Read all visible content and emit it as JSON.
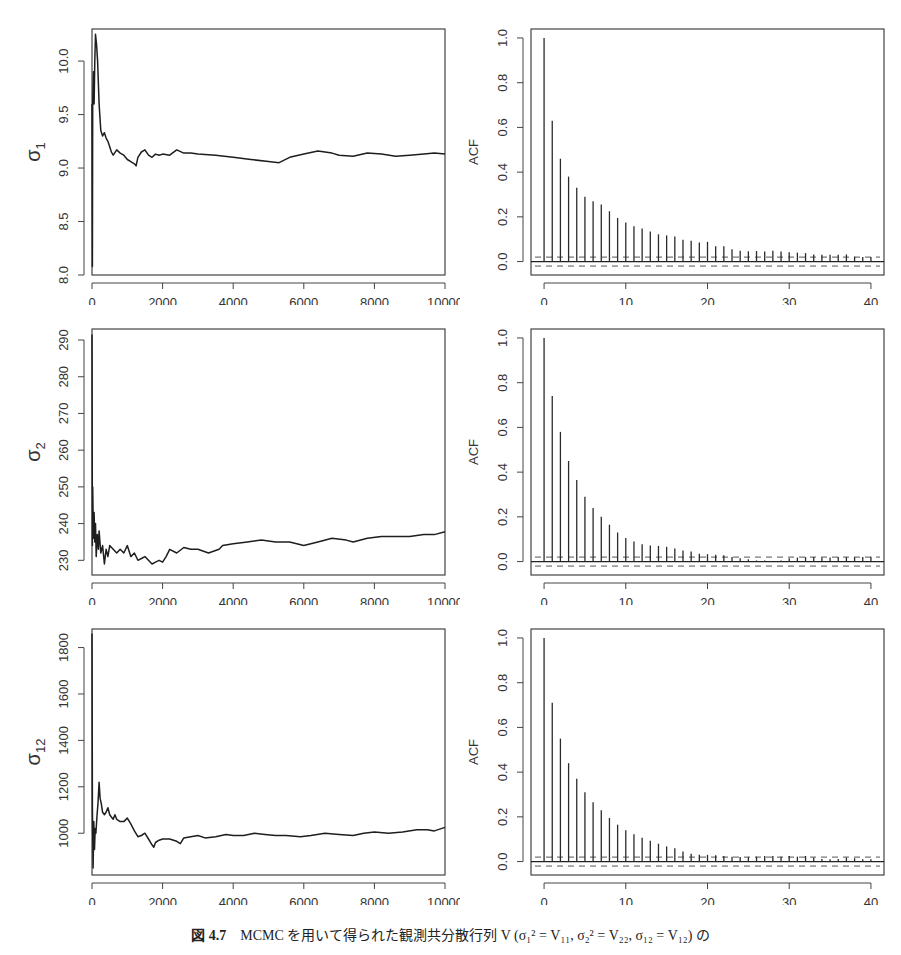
{
  "caption": {
    "figure_label": "図 4.7",
    "text": "MCMC を用いて得られた観測共分散行列 V (σ₁² = V₁₁,  σ₂² = V₂₂,  σ₁₂ = V₁₂) の"
  },
  "chart_data": [
    {
      "type": "line",
      "title": "",
      "panel": "trace-sigma1",
      "xlabel": "",
      "ylabel": "σ1",
      "ylabel_main": "σ",
      "ylabel_sub": "1",
      "xlim": [
        0,
        10000
      ],
      "ylim": [
        8.0,
        10.3
      ],
      "xticks": [
        0,
        2000,
        4000,
        6000,
        8000,
        10000
      ],
      "yticks": [
        8.0,
        8.5,
        9.0,
        9.5,
        10.0
      ],
      "ytick_labels": [
        "8.0",
        "8.5",
        "9.0",
        "9.5",
        "10.0"
      ],
      "grid": false,
      "x": [
        0,
        10,
        20,
        40,
        60,
        80,
        100,
        130,
        160,
        200,
        250,
        300,
        350,
        400,
        450,
        500,
        550,
        600,
        700,
        800,
        900,
        1000,
        1100,
        1200,
        1250,
        1300,
        1400,
        1500,
        1600,
        1700,
        1800,
        1900,
        2000,
        2200,
        2400,
        2600,
        2800,
        3000,
        3500,
        4000,
        4500,
        5000,
        5300,
        5600,
        6000,
        6400,
        6800,
        7000,
        7400,
        7800,
        8200,
        8600,
        9000,
        9400,
        9700,
        10000
      ],
      "values": [
        9.6,
        8.08,
        9.6,
        9.9,
        9.6,
        10.0,
        10.25,
        10.15,
        10.0,
        9.6,
        9.35,
        9.3,
        9.33,
        9.28,
        9.25,
        9.2,
        9.15,
        9.12,
        9.17,
        9.14,
        9.12,
        9.08,
        9.06,
        9.04,
        9.02,
        9.1,
        9.15,
        9.17,
        9.12,
        9.1,
        9.13,
        9.12,
        9.13,
        9.12,
        9.17,
        9.14,
        9.14,
        9.13,
        9.12,
        9.1,
        9.08,
        9.06,
        9.05,
        9.1,
        9.13,
        9.16,
        9.14,
        9.12,
        9.11,
        9.14,
        9.13,
        9.11,
        9.12,
        9.13,
        9.14,
        9.13
      ]
    },
    {
      "type": "bar",
      "title": "",
      "panel": "acf-sigma1",
      "xlabel": "",
      "ylabel": "ACF",
      "xlim": [
        -1.6,
        41.6
      ],
      "ylim": [
        -0.06,
        1.04
      ],
      "xticks": [
        0,
        10,
        20,
        30,
        40
      ],
      "yticks": [
        0.0,
        0.2,
        0.4,
        0.6,
        0.8,
        1.0
      ],
      "ytick_labels": [
        "0.0",
        "0.2",
        "0.4",
        "0.6",
        "0.8",
        "1.0"
      ],
      "confidence_band": 0.02,
      "grid": false,
      "categories": [
        0,
        1,
        2,
        3,
        4,
        5,
        6,
        7,
        8,
        9,
        10,
        11,
        12,
        13,
        14,
        15,
        16,
        17,
        18,
        19,
        20,
        21,
        22,
        23,
        24,
        25,
        26,
        27,
        28,
        29,
        30,
        31,
        32,
        33,
        34,
        35,
        36,
        37,
        38,
        39,
        40
      ],
      "values": [
        1.0,
        0.63,
        0.46,
        0.38,
        0.33,
        0.29,
        0.27,
        0.255,
        0.225,
        0.195,
        0.175,
        0.158,
        0.148,
        0.135,
        0.122,
        0.117,
        0.112,
        0.098,
        0.093,
        0.085,
        0.088,
        0.068,
        0.068,
        0.055,
        0.048,
        0.046,
        0.047,
        0.045,
        0.048,
        0.045,
        0.042,
        0.04,
        0.038,
        0.032,
        0.03,
        0.03,
        0.03,
        0.032,
        0.022,
        0.02,
        0.02
      ]
    },
    {
      "type": "line",
      "title": "",
      "panel": "trace-sigma2",
      "xlabel": "",
      "ylabel": "σ2",
      "ylabel_main": "σ",
      "ylabel_sub": "2",
      "xlim": [
        0,
        10000
      ],
      "ylim": [
        226,
        293
      ],
      "xticks": [
        0,
        2000,
        4000,
        6000,
        8000,
        10000
      ],
      "yticks": [
        230,
        240,
        250,
        260,
        270,
        280,
        290
      ],
      "ytick_labels": [
        "230",
        "240",
        "250",
        "260",
        "270",
        "280",
        "290"
      ],
      "grid": false,
      "x": [
        0,
        10,
        20,
        40,
        60,
        80,
        100,
        120,
        150,
        180,
        200,
        250,
        300,
        350,
        400,
        450,
        500,
        600,
        700,
        800,
        900,
        1000,
        1100,
        1200,
        1300,
        1400,
        1500,
        1600,
        1700,
        1800,
        1900,
        2000,
        2100,
        2200,
        2400,
        2600,
        2800,
        3000,
        3300,
        3600,
        3700,
        4000,
        4400,
        4800,
        5200,
        5600,
        6000,
        6400,
        6800,
        7200,
        7400,
        7800,
        8200,
        8600,
        9000,
        9400,
        9700,
        10000
      ],
      "values": [
        291.5,
        234,
        250,
        236,
        243,
        235,
        240,
        231,
        237,
        233,
        238,
        232,
        234,
        229,
        233,
        231,
        234,
        233,
        232,
        233,
        232,
        234,
        231,
        232,
        230,
        230.5,
        231,
        230,
        229,
        229.5,
        230,
        229.5,
        231,
        233,
        232,
        233.5,
        233,
        233,
        232,
        233,
        234,
        234.5,
        235,
        235.5,
        235,
        235,
        234,
        235,
        236,
        235.5,
        235,
        236,
        236.5,
        236.5,
        236.5,
        237,
        237,
        237.8
      ]
    },
    {
      "type": "bar",
      "title": "",
      "panel": "acf-sigma2",
      "xlabel": "",
      "ylabel": "ACF",
      "xlim": [
        -1.6,
        41.6
      ],
      "ylim": [
        -0.06,
        1.04
      ],
      "xticks": [
        0,
        10,
        20,
        30,
        40
      ],
      "yticks": [
        0.0,
        0.2,
        0.4,
        0.6,
        0.8,
        1.0
      ],
      "ytick_labels": [
        "0.0",
        "0.2",
        "0.4",
        "0.6",
        "0.8",
        "1.0"
      ],
      "confidence_band": 0.02,
      "grid": false,
      "categories": [
        0,
        1,
        2,
        3,
        4,
        5,
        6,
        7,
        8,
        9,
        10,
        11,
        12,
        13,
        14,
        15,
        16,
        17,
        18,
        19,
        20,
        21,
        22,
        23,
        24,
        25,
        26,
        27,
        28,
        29,
        30,
        31,
        32,
        33,
        34,
        35,
        36,
        37,
        38,
        39,
        40
      ],
      "values": [
        1.0,
        0.74,
        0.58,
        0.45,
        0.365,
        0.29,
        0.24,
        0.2,
        0.165,
        0.13,
        0.105,
        0.09,
        0.078,
        0.072,
        0.07,
        0.066,
        0.058,
        0.05,
        0.045,
        0.035,
        0.033,
        0.03,
        0.028,
        0.02,
        0.015,
        0.01,
        0.005,
        0.005,
        0.003,
        0.005,
        0.015,
        0.018,
        0.02,
        0.02,
        0.018,
        0.018,
        0.02,
        0.02,
        0.02,
        0.02,
        0.022
      ]
    },
    {
      "type": "line",
      "title": "",
      "panel": "trace-sigma12",
      "xlabel": "",
      "ylabel": "σ12",
      "ylabel_main": "σ",
      "ylabel_sub": "12",
      "xlim": [
        0,
        10000
      ],
      "ylim": [
        820,
        1880
      ],
      "xticks": [
        0,
        2000,
        4000,
        6000,
        8000,
        10000
      ],
      "yticks": [
        1000,
        1200,
        1400,
        1600,
        1800
      ],
      "ytick_labels": [
        "1000",
        "1200",
        "1400",
        "1600",
        "1800"
      ],
      "grid": false,
      "x": [
        0,
        10,
        30,
        50,
        70,
        90,
        110,
        140,
        170,
        200,
        230,
        260,
        300,
        350,
        400,
        450,
        500,
        550,
        600,
        650,
        700,
        800,
        900,
        1000,
        1100,
        1200,
        1300,
        1400,
        1500,
        1600,
        1700,
        1750,
        1800,
        1900,
        2000,
        2200,
        2400,
        2500,
        2600,
        2800,
        3000,
        3200,
        3500,
        3800,
        4000,
        4300,
        4600,
        4900,
        5200,
        5500,
        5900,
        6200,
        6600,
        7000,
        7400,
        7700,
        8000,
        8400,
        8800,
        9200,
        9500,
        9700,
        10000
      ],
      "values": [
        1860,
        1110,
        850,
        1050,
        930,
        1020,
        1000,
        1070,
        1130,
        1220,
        1150,
        1130,
        1090,
        1080,
        1090,
        1110,
        1080,
        1070,
        1060,
        1080,
        1060,
        1050,
        1050,
        1065,
        1040,
        1010,
        985,
        990,
        1000,
        975,
        950,
        940,
        960,
        970,
        975,
        975,
        965,
        955,
        980,
        985,
        990,
        980,
        985,
        995,
        990,
        990,
        1000,
        995,
        990,
        990,
        985,
        990,
        1000,
        995,
        990,
        1000,
        1005,
        1000,
        1005,
        1015,
        1015,
        1010,
        1025
      ]
    },
    {
      "type": "bar",
      "title": "",
      "panel": "acf-sigma12",
      "xlabel": "",
      "ylabel": "ACF",
      "xlim": [
        -1.6,
        41.6
      ],
      "ylim": [
        -0.06,
        1.04
      ],
      "xticks": [
        0,
        10,
        20,
        30,
        40
      ],
      "yticks": [
        0.0,
        0.2,
        0.4,
        0.6,
        0.8,
        1.0
      ],
      "ytick_labels": [
        "0.0",
        "0.2",
        "0.4",
        "0.6",
        "0.8",
        "1.0"
      ],
      "confidence_band": 0.02,
      "grid": false,
      "categories": [
        0,
        1,
        2,
        3,
        4,
        5,
        6,
        7,
        8,
        9,
        10,
        11,
        12,
        13,
        14,
        15,
        16,
        17,
        18,
        19,
        20,
        21,
        22,
        23,
        24,
        25,
        26,
        27,
        28,
        29,
        30,
        31,
        32,
        33,
        34,
        35,
        36,
        37,
        38,
        39,
        40
      ],
      "values": [
        1.0,
        0.71,
        0.55,
        0.44,
        0.37,
        0.31,
        0.265,
        0.23,
        0.195,
        0.165,
        0.14,
        0.122,
        0.107,
        0.093,
        0.08,
        0.068,
        0.06,
        0.045,
        0.035,
        0.03,
        0.03,
        0.028,
        0.025,
        0.022,
        0.02,
        0.02,
        0.022,
        0.025,
        0.025,
        0.022,
        0.025,
        0.022,
        0.025,
        0.018,
        0.012,
        0.01,
        0.012,
        0.018,
        0.015,
        0.01,
        0.01
      ]
    }
  ]
}
